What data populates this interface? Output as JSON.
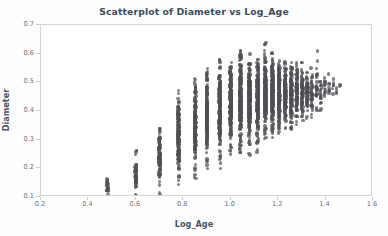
{
  "chart_data": {
    "type": "scatter",
    "title": "Scatterplot of Diameter vs Log_Age",
    "xlabel": "Log_Age",
    "ylabel": "Diameter",
    "xlim": [
      0.2,
      1.6
    ],
    "ylim": [
      0.1,
      0.7
    ],
    "xticks": [
      0.2,
      0.4,
      0.6,
      0.8,
      1.0,
      1.2,
      1.4,
      1.6
    ],
    "xticklabels": [
      "0.2",
      "0.4",
      "0.6",
      "0.8",
      "1.0",
      "1.2",
      "1.4",
      "1.6"
    ],
    "yticks": [
      0.1,
      0.2,
      0.3,
      0.4,
      0.5,
      0.6,
      0.7
    ],
    "yticklabels": [
      "0.1",
      "0.2",
      "0.3",
      "0.4",
      "0.5",
      "0.6",
      "0.7"
    ],
    "grid": false,
    "legend": null,
    "marker_color": "#4f4f54",
    "marker_opacity": 0.72,
    "marker_size_px": 3.4,
    "frame_color": "#d2d4d7",
    "title_color": "#3b4a5a",
    "label_color": "#4a545f",
    "tick_color": "#6d7278",
    "background": "#ffffff",
    "columns": [
      {
        "x": 0.3,
        "n": 2,
        "ymin": 0.1,
        "ymax": 0.102,
        "ycore": [
          0.1,
          0.101
        ]
      },
      {
        "x": 0.48,
        "n": 26,
        "ymin": 0.092,
        "ymax": 0.178,
        "ycore": [
          0.11,
          0.155
        ]
      },
      {
        "x": 0.6,
        "n": 60,
        "ymin": 0.09,
        "ymax": 0.27,
        "ycore": [
          0.125,
          0.215
        ]
      },
      {
        "x": 0.7,
        "n": 100,
        "ymin": 0.108,
        "ymax": 0.34,
        "ycore": [
          0.175,
          0.3
        ]
      },
      {
        "x": 0.78,
        "n": 150,
        "ymin": 0.122,
        "ymax": 0.475,
        "ycore": [
          0.23,
          0.4
        ]
      },
      {
        "x": 0.85,
        "n": 185,
        "ymin": 0.158,
        "ymax": 0.515,
        "ycore": [
          0.27,
          0.45
        ]
      },
      {
        "x": 0.9,
        "n": 210,
        "ymin": 0.196,
        "ymax": 0.562,
        "ycore": [
          0.3,
          0.48
        ]
      },
      {
        "x": 0.954,
        "n": 230,
        "ymin": 0.2,
        "ymax": 0.58,
        "ycore": [
          0.32,
          0.5
        ]
      },
      {
        "x": 1.0,
        "n": 245,
        "ymin": 0.225,
        "ymax": 0.585,
        "ycore": [
          0.34,
          0.515
        ]
      },
      {
        "x": 1.041,
        "n": 250,
        "ymin": 0.238,
        "ymax": 0.62,
        "ycore": [
          0.35,
          0.525
        ]
      },
      {
        "x": 1.079,
        "n": 245,
        "ymin": 0.24,
        "ymax": 0.622,
        "ycore": [
          0.355,
          0.528
        ]
      },
      {
        "x": 1.114,
        "n": 225,
        "ymin": 0.248,
        "ymax": 0.58,
        "ycore": [
          0.36,
          0.53
        ]
      },
      {
        "x": 1.146,
        "n": 205,
        "ymin": 0.3,
        "ymax": 0.645,
        "ycore": [
          0.375,
          0.535
        ]
      },
      {
        "x": 1.176,
        "n": 185,
        "ymin": 0.3,
        "ymax": 0.605,
        "ycore": [
          0.38,
          0.535
        ]
      },
      {
        "x": 1.204,
        "n": 165,
        "ymin": 0.31,
        "ymax": 0.575,
        "ycore": [
          0.385,
          0.535
        ]
      },
      {
        "x": 1.23,
        "n": 140,
        "ymin": 0.32,
        "ymax": 0.58,
        "ycore": [
          0.39,
          0.535
        ]
      },
      {
        "x": 1.255,
        "n": 120,
        "ymin": 0.33,
        "ymax": 0.58,
        "ycore": [
          0.395,
          0.535
        ]
      },
      {
        "x": 1.279,
        "n": 100,
        "ymin": 0.345,
        "ymax": 0.575,
        "ycore": [
          0.4,
          0.535
        ]
      },
      {
        "x": 1.301,
        "n": 85,
        "ymin": 0.36,
        "ymax": 0.57,
        "ycore": [
          0.405,
          0.53
        ]
      },
      {
        "x": 1.322,
        "n": 62,
        "ymin": 0.365,
        "ymax": 0.56,
        "ycore": [
          0.41,
          0.525
        ]
      },
      {
        "x": 1.342,
        "n": 46,
        "ymin": 0.37,
        "ymax": 0.55,
        "ycore": [
          0.415,
          0.52
        ]
      },
      {
        "x": 1.362,
        "n": 30,
        "ymin": 0.385,
        "ymax": 0.62,
        "ycore": [
          0.42,
          0.52
        ]
      },
      {
        "x": 1.38,
        "n": 20,
        "ymin": 0.4,
        "ymax": 0.545,
        "ycore": [
          0.43,
          0.515
        ]
      },
      {
        "x": 1.398,
        "n": 14,
        "ymin": 0.42,
        "ymax": 0.54,
        "ycore": [
          0.44,
          0.52
        ]
      },
      {
        "x": 1.415,
        "n": 9,
        "ymin": 0.44,
        "ymax": 0.53,
        "ycore": [
          0.45,
          0.515
        ]
      },
      {
        "x": 1.431,
        "n": 6,
        "ymin": 0.45,
        "ymax": 0.52,
        "ycore": [
          0.455,
          0.51
        ]
      },
      {
        "x": 1.447,
        "n": 4,
        "ymin": 0.455,
        "ymax": 0.53,
        "ycore": [
          0.46,
          0.505
        ]
      },
      {
        "x": 1.462,
        "n": 3,
        "ymin": 0.46,
        "ymax": 0.578,
        "ycore": [
          0.465,
          0.5
        ]
      }
    ]
  }
}
